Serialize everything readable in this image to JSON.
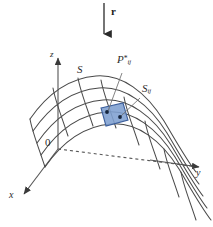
{
  "figure": {
    "kind": "surface-integral-diagram",
    "background_color": "#ffffff",
    "stroke_color": "#4a4a4a",
    "axis_color": "#555555",
    "patch_fill_color": "#7e9fd0",
    "patch_stroke_color": "#3c5f9c",
    "dot_color": "#16263f",
    "leader_color": "#6e6e6e",
    "dashed_color": "#9a9a9a"
  },
  "labels": {
    "vector_r": "r",
    "surface": "S",
    "axis_z": "z",
    "axis_y": "y",
    "axis_x": "x",
    "origin": "0",
    "sample_point": "P",
    "sample_point_star": "*",
    "sample_point_sub": "ij",
    "patch": "S",
    "patch_sub": "ij"
  },
  "geometry": {
    "vector_arrow": {
      "x": 104,
      "y_start": 3,
      "y_end": 38,
      "direction": "down",
      "label_offset_x": 7,
      "label_offset_y": 8
    },
    "axes": {
      "origin": [
        58,
        149
      ],
      "z_tip": [
        58,
        54
      ],
      "y_tip": [
        204,
        167
      ],
      "x_tip": [
        20,
        197
      ]
    },
    "patch_quad": [
      [
        101,
        108
      ],
      [
        123,
        103
      ],
      [
        128,
        120
      ],
      [
        106,
        126
      ]
    ],
    "dots": [
      {
        "cx": 107,
        "cy": 112,
        "r": 1.8
      },
      {
        "cx": 120,
        "cy": 117,
        "r": 1.8
      }
    ],
    "leaders": [
      {
        "from": [
          122,
          72
        ],
        "to": [
          107,
          112
        ]
      },
      {
        "from": [
          141,
          97
        ],
        "to": [
          120,
          117
        ]
      }
    ],
    "label_positions": {
      "vector_r": [
        111,
        8
      ],
      "surface": [
        79,
        68
      ],
      "axis_z": [
        51,
        51
      ],
      "axis_y": [
        196,
        170
      ],
      "axis_x": [
        10,
        194
      ],
      "origin": [
        46,
        140
      ],
      "sample_point": [
        119,
        57
      ],
      "patch": [
        144,
        86
      ]
    }
  },
  "surface": {
    "description": "wavy parametric mesh surface, rises at left, dips toward right-front",
    "u_lines": 6,
    "v_lines": 7
  }
}
